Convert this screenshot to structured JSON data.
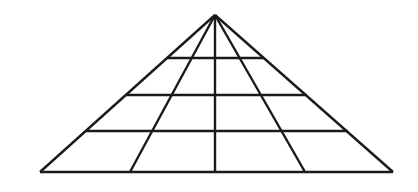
{
  "figure": {
    "name": "pyramid-grid-diagram",
    "background_color": "#ffffff",
    "stroke_color": "#1a1a1a",
    "stroke_width": 2.4,
    "canvas": {
      "width": 418,
      "height": 192
    },
    "geometry": {
      "apex": {
        "x": 215,
        "y": 15
      },
      "base_left": {
        "x": 40,
        "y": 172
      },
      "base_right": {
        "x": 393,
        "y": 172
      },
      "base_y": 172,
      "tier_count": 4,
      "radiating_line_count": 5,
      "horizontal_line_count": 4
    },
    "outline": {
      "left_edge": {
        "x1": 215,
        "y1": 15,
        "x2": 40,
        "y2": 172
      },
      "right_edge": {
        "x1": 215,
        "y1": 15,
        "x2": 393,
        "y2": 172
      },
      "base_edge": {
        "x1": 40,
        "y1": 172,
        "x2": 393,
        "y2": 172
      }
    },
    "radiating_lines": [
      {
        "name": "left-outer-edge",
        "x1": 215,
        "y1": 15,
        "x2": 40,
        "y2": 172
      },
      {
        "name": "left-inner-diagonal",
        "x1": 215,
        "y1": 15,
        "x2": 130,
        "y2": 172
      },
      {
        "name": "center-vertical",
        "x1": 215,
        "y1": 15,
        "x2": 215,
        "y2": 172
      },
      {
        "name": "right-inner-diagonal",
        "x1": 215,
        "y1": 15,
        "x2": 305,
        "y2": 172
      },
      {
        "name": "right-outer-edge",
        "x1": 215,
        "y1": 15,
        "x2": 393,
        "y2": 172
      }
    ],
    "horizontal_lines": [
      {
        "name": "tier-line-1",
        "y": 58,
        "x1": 167,
        "x2": 264
      },
      {
        "name": "tier-line-2",
        "y": 95,
        "x1": 126,
        "x2": 307
      },
      {
        "name": "tier-line-3",
        "y": 131,
        "x1": 86,
        "x2": 348
      },
      {
        "name": "base-line",
        "y": 172,
        "x1": 40,
        "x2": 393
      }
    ]
  }
}
